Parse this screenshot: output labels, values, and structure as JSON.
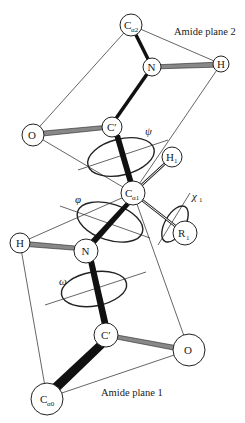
{
  "planes": {
    "top_label": "Amide plane 2",
    "bottom_label": "Amide plane 1"
  },
  "atoms": {
    "ca2": {
      "main": "C",
      "sub": "α2"
    },
    "n_top": {
      "main": "N"
    },
    "h_top": {
      "main": "H"
    },
    "c_prime_top": {
      "main": "C′"
    },
    "o_top": {
      "main": "O"
    },
    "h1": {
      "main": "H",
      "sub": "1"
    },
    "ca1": {
      "main": "C",
      "sub": "α1"
    },
    "r1": {
      "main": "R",
      "sub": "1"
    },
    "h_mid": {
      "main": "H"
    },
    "n_mid": {
      "main": "N"
    },
    "c_prime_bottom": {
      "main": "C′"
    },
    "o_bottom": {
      "main": "O"
    },
    "ca0": {
      "main": "C",
      "sub": "α0"
    }
  },
  "angles": {
    "psi": "ψ",
    "phi": "φ",
    "omega": "ω",
    "chi1_main": "χ",
    "chi1_sub": "1"
  },
  "colors": {
    "stroke": "#222222",
    "double_bond_fill": "#888888",
    "background": "#ffffff"
  }
}
